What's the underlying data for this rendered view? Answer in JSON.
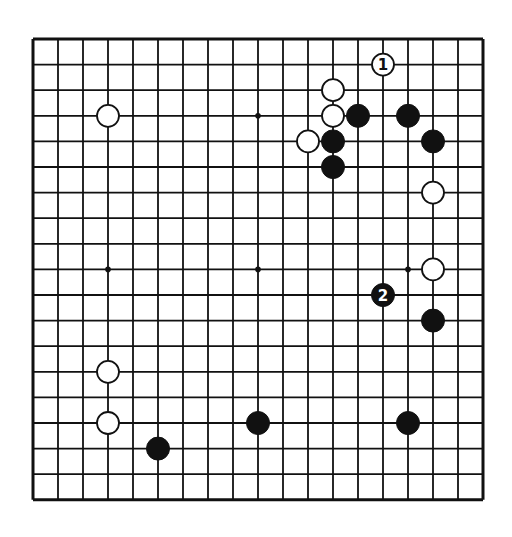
{
  "board": {
    "size": 19,
    "origin_x": 33,
    "origin_y": 39,
    "spacing_x": 25,
    "spacing_y": 25.6,
    "line_color": "#111111",
    "background": "#ffffff",
    "star_points": [
      [
        3,
        3
      ],
      [
        9,
        3
      ],
      [
        15,
        3
      ],
      [
        3,
        9
      ],
      [
        9,
        9
      ],
      [
        15,
        9
      ],
      [
        3,
        15
      ],
      [
        9,
        15
      ],
      [
        15,
        15
      ]
    ]
  },
  "stones": [
    {
      "color": "white",
      "col": 3,
      "row": 3
    },
    {
      "color": "white",
      "col": 14,
      "row": 1,
      "label": "1"
    },
    {
      "color": "white",
      "col": 12,
      "row": 2
    },
    {
      "color": "white",
      "col": 12,
      "row": 3
    },
    {
      "color": "black",
      "col": 13,
      "row": 3
    },
    {
      "color": "black",
      "col": 15,
      "row": 3
    },
    {
      "color": "white",
      "col": 11,
      "row": 4
    },
    {
      "color": "black",
      "col": 12,
      "row": 4
    },
    {
      "color": "black",
      "col": 16,
      "row": 4
    },
    {
      "color": "black",
      "col": 12,
      "row": 5
    },
    {
      "color": "white",
      "col": 16,
      "row": 6
    },
    {
      "color": "white",
      "col": 16,
      "row": 9
    },
    {
      "color": "black",
      "col": 14,
      "row": 10,
      "label": "2"
    },
    {
      "color": "black",
      "col": 16,
      "row": 11
    },
    {
      "color": "white",
      "col": 3,
      "row": 13
    },
    {
      "color": "white",
      "col": 3,
      "row": 15
    },
    {
      "color": "black",
      "col": 9,
      "row": 15
    },
    {
      "color": "black",
      "col": 15,
      "row": 15
    },
    {
      "color": "black",
      "col": 5,
      "row": 16
    }
  ]
}
